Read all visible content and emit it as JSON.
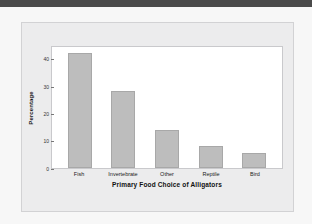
{
  "figure": {
    "background_color": "#ececed",
    "plot_background_color": "#ffffff",
    "bar_color": "#bdbdbd",
    "top_band_color": "#4a4a4a"
  },
  "chart_data": {
    "type": "bar",
    "title": "",
    "xlabel": "Primary Food Choice of Alligators",
    "ylabel": "Percentage",
    "categories": [
      "Fish",
      "Invertebrate",
      "Other",
      "Reptile",
      "Bird"
    ],
    "values": [
      42,
      28,
      14,
      8,
      5.5
    ],
    "ylim": [
      0,
      45
    ],
    "yticks": [
      0,
      10,
      20,
      30,
      40
    ],
    "ytick_labels": [
      "0",
      "10",
      "20",
      "30",
      "40"
    ],
    "grid": false,
    "legend": null
  }
}
